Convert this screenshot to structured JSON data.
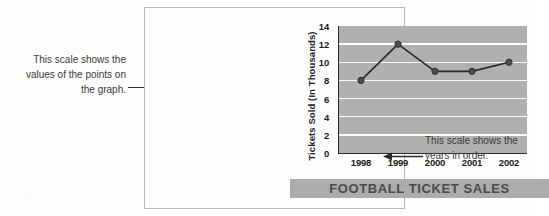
{
  "figure": {
    "annotation_left": "This scale shows the values of the points on the graph.",
    "annotation_right": "This scale shows the years in order."
  },
  "chart_data": {
    "type": "line",
    "title": "FOOTBALL TICKET SALES",
    "xlabel": "",
    "ylabel": "Tickets Sold (In Thousands)",
    "categories": [
      "1998",
      "1999",
      "2000",
      "2001",
      "2002"
    ],
    "values": [
      8,
      12,
      9,
      9,
      10
    ],
    "ylim": [
      0,
      14
    ],
    "yticks": [
      0,
      2,
      4,
      6,
      8,
      10,
      12,
      14
    ],
    "grid": true,
    "legend": "none",
    "plot_background": "#b0b0b0",
    "gridline_color": "#fcfcfc",
    "line_color": "#2b2b2b",
    "marker_color": "#4f4f4f",
    "banner_color": "#acacac",
    "title_color": "#4a4a4a"
  }
}
